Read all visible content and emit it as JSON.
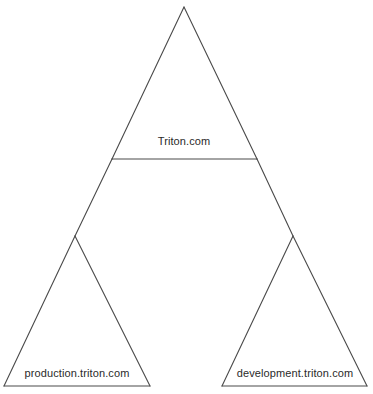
{
  "diagram": {
    "type": "domain-tree",
    "nodes": [
      {
        "id": "root",
        "label": "Triton.com",
        "shape": "triangle"
      },
      {
        "id": "production",
        "label": "production.triton.com",
        "shape": "triangle",
        "parent": "root"
      },
      {
        "id": "development",
        "label": "development.triton.com",
        "shape": "triangle",
        "parent": "root"
      }
    ],
    "edges": [
      {
        "from": "root",
        "to": "production"
      },
      {
        "from": "root",
        "to": "development"
      }
    ],
    "colors": {
      "stroke": "#4a4a4a",
      "text": "#2a2a2a",
      "background": "#ffffff"
    }
  }
}
